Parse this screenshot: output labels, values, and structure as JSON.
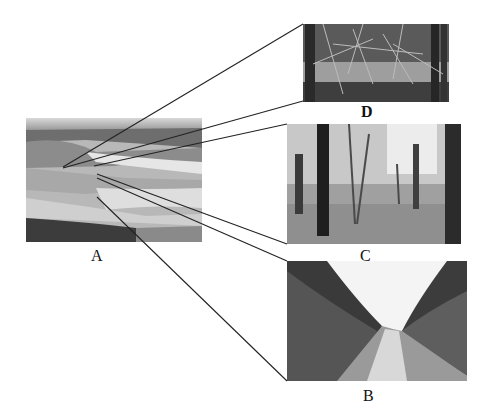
{
  "figure": {
    "photos": [
      {
        "id": "A",
        "label": "A",
        "description": "Badlands landscape with eroded grassy hills"
      },
      {
        "id": "D",
        "label": "D",
        "description": "Dense tangled woodland thicket"
      },
      {
        "id": "C",
        "label": "C",
        "description": "Open deciduous forest with leaf-litter floor"
      },
      {
        "id": "B",
        "label": "B",
        "description": "River channel bordered by dense vegetation"
      }
    ],
    "connector_color": "#222222"
  }
}
